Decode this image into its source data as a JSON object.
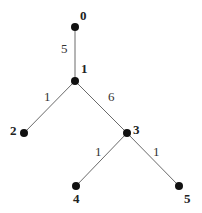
{
  "diagram": {
    "type": "weighted-tree",
    "nodes": [
      {
        "id": "0",
        "label": "0",
        "x": 75,
        "y": 27,
        "lx": 80,
        "ly": 20
      },
      {
        "id": "1",
        "label": "1",
        "x": 75,
        "y": 81,
        "lx": 81,
        "ly": 73
      },
      {
        "id": "2",
        "label": "2",
        "x": 24,
        "y": 133,
        "lx": 10,
        "ly": 135
      },
      {
        "id": "3",
        "label": "3",
        "x": 127,
        "y": 133,
        "lx": 133,
        "ly": 134
      },
      {
        "id": "4",
        "label": "4",
        "x": 76,
        "y": 186,
        "lx": 73,
        "ly": 203
      },
      {
        "id": "5",
        "label": "5",
        "x": 179,
        "y": 186,
        "lx": 184,
        "ly": 203
      }
    ],
    "edges": [
      {
        "from": "0",
        "to": "1",
        "weight": "5",
        "wx": 61,
        "wy": 53
      },
      {
        "from": "1",
        "to": "2",
        "weight": "1",
        "wx": 44,
        "wy": 101
      },
      {
        "from": "1",
        "to": "3",
        "weight": "6",
        "wx": 108,
        "wy": 101
      },
      {
        "from": "3",
        "to": "4",
        "weight": "1",
        "wx": 95,
        "wy": 156
      },
      {
        "from": "3",
        "to": "5",
        "weight": "1",
        "wx": 153,
        "wy": 156
      }
    ]
  },
  "labels": {
    "node_0": "0",
    "node_1": "1",
    "node_2": "2",
    "node_3": "3",
    "node_4": "4",
    "node_5": "5",
    "edge_0_1": "5",
    "edge_1_2": "1",
    "edge_1_3": "6",
    "edge_3_4": "1",
    "edge_3_5": "1"
  },
  "colors": {
    "node": "#111111",
    "edge": "#6a6a6a",
    "text": "#222222",
    "background": "#ffffff"
  }
}
